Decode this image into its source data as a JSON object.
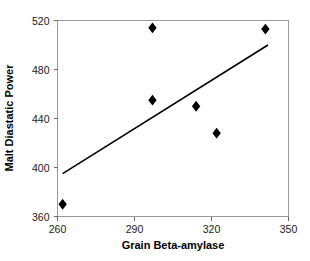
{
  "chart_data": {
    "type": "scatter",
    "title": "",
    "xlabel": "Grain Beta-amylase",
    "ylabel": "Malt Diastatic Power",
    "xlim": [
      260,
      350
    ],
    "ylim": [
      360,
      520
    ],
    "xticks": [
      260,
      290,
      320,
      350
    ],
    "yticks": [
      360,
      400,
      440,
      480,
      520
    ],
    "xtick_labels": [
      "260",
      "290",
      "320",
      "350"
    ],
    "ytick_labels": [
      "360",
      "400",
      "440",
      "480",
      "520"
    ],
    "grid": false,
    "legend": null,
    "marker": "diamond",
    "marker_color": "#000000",
    "points": [
      {
        "x": 262,
        "y": 370
      },
      {
        "x": 297,
        "y": 514
      },
      {
        "x": 297,
        "y": 455
      },
      {
        "x": 314,
        "y": 450
      },
      {
        "x": 322,
        "y": 428
      },
      {
        "x": 341,
        "y": 513
      }
    ],
    "trendline": {
      "type": "linear",
      "color": "#000000",
      "x_start": 262,
      "y_start": 395,
      "x_end": 342,
      "y_end": 500
    },
    "frame_color": "#9a9a9a",
    "background_color": "#ffffff"
  }
}
